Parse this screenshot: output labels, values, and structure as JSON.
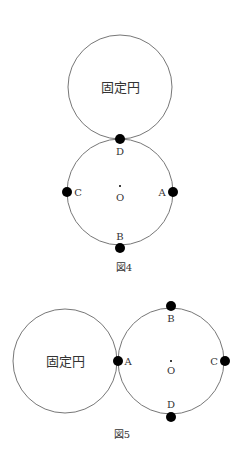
{
  "figure4": {
    "caption": "図4",
    "fixed_circle_label": "固定円",
    "center_label": "O",
    "points": {
      "A": "A",
      "B": "B",
      "C": "C",
      "D": "D"
    }
  },
  "figure5": {
    "caption": "図5",
    "fixed_circle_label": "固定円",
    "center_label": "O",
    "points": {
      "A": "A",
      "B": "B",
      "C": "C",
      "D": "D"
    }
  },
  "colors": {
    "line": "#777777",
    "dot": "#000000",
    "text": "#333333"
  }
}
